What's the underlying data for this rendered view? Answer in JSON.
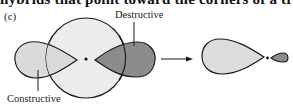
{
  "header": {
    "clipped_text": "hybrids that point toward the corners of a trigonal"
  },
  "figure": {
    "panel_label": "(c)",
    "labels": {
      "destructive": "Destructive",
      "constructive": "Constructive"
    },
    "colors": {
      "outline": "#1a1a1a",
      "s_orbital_fill": "#ececec",
      "constructive_fill": "#dadada",
      "destructive_fill": "#8c8c8c",
      "result_large_fill": "#dcdcdc",
      "result_small_fill": "#8c8c8c"
    }
  }
}
